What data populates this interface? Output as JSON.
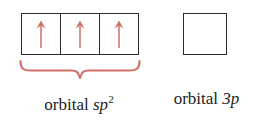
{
  "figure": {
    "background_color": "#ffffff",
    "box_border_color": "#2b2b2b",
    "arrow_color": "#cf6f65",
    "brace_color": "#cf6f65",
    "text_color": "#1d1d1d"
  },
  "groups": [
    {
      "id": "sp2",
      "name": "sp2-orbital-group",
      "box_count": 3,
      "electrons_per_box": [
        1,
        1,
        1
      ],
      "arrow_direction": "up",
      "has_brace": true,
      "caption": {
        "prefix": "orbital",
        "term": "sp",
        "superscript": "2",
        "full_text": "orbital sp2"
      }
    },
    {
      "id": "3p",
      "name": "3p-orbital-group",
      "box_count": 1,
      "electrons_per_box": [
        0
      ],
      "arrow_direction": null,
      "has_brace": false,
      "caption": {
        "prefix": "orbital",
        "term": "3p",
        "superscript": "",
        "full_text": "orbital 3p"
      }
    }
  ],
  "captions": {
    "sp2_prefix": "orbital",
    "sp2_term": "sp",
    "sp2_superscript": "2",
    "p_prefix": "orbital",
    "p_term": "3p"
  }
}
